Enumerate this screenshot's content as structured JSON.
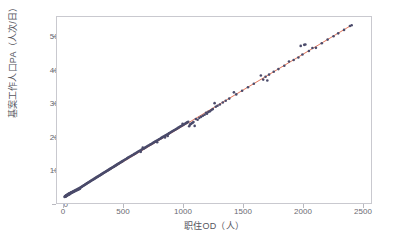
{
  "chart_data": {
    "type": "scatter",
    "title": "",
    "xlabel": "职住OD（人）",
    "ylabel": "基案工作人口PA（人次/日）",
    "xlim": [
      -60,
      2620
    ],
    "ylim": [
      -180,
      5560
    ],
    "xticks": [
      0,
      500,
      1000,
      1500,
      2000,
      2500
    ],
    "yticks": [
      0,
      1000,
      2000,
      3000,
      4000,
      5000
    ],
    "xtick_labels": [
      "0",
      "500",
      "1000",
      "1500",
      "2000",
      "2500"
    ],
    "ytick_labels": [
      "0",
      "1000",
      "2000",
      "3000",
      "4000",
      "5000"
    ],
    "grid": false,
    "legend": null,
    "point_color": "#4b4b6b",
    "point_size": 1.9,
    "frame_color": "#c9c9cf",
    "tick_color": "#6b6b72",
    "series": [
      {
        "name": "观测点",
        "type": "scatter",
        "points": [
          [
            5,
            8
          ],
          [
            8,
            20
          ],
          [
            10,
            15
          ],
          [
            12,
            35
          ],
          [
            14,
            22
          ],
          [
            16,
            48
          ],
          [
            18,
            30
          ],
          [
            20,
            55
          ],
          [
            22,
            40
          ],
          [
            24,
            68
          ],
          [
            26,
            50
          ],
          [
            28,
            75
          ],
          [
            30,
            60
          ],
          [
            32,
            88
          ],
          [
            34,
            70
          ],
          [
            36,
            95
          ],
          [
            38,
            78
          ],
          [
            40,
            105
          ],
          [
            42,
            85
          ],
          [
            44,
            112
          ],
          [
            46,
            92
          ],
          [
            48,
            120
          ],
          [
            50,
            100
          ],
          [
            52,
            130
          ],
          [
            55,
            110
          ],
          [
            58,
            140
          ],
          [
            60,
            125
          ],
          [
            63,
            150
          ],
          [
            66,
            135
          ],
          [
            69,
            160
          ],
          [
            72,
            145
          ],
          [
            75,
            172
          ],
          [
            78,
            158
          ],
          [
            81,
            185
          ],
          [
            84,
            168
          ],
          [
            87,
            195
          ],
          [
            90,
            180
          ],
          [
            94,
            208
          ],
          [
            97,
            190
          ],
          [
            100,
            220
          ],
          [
            104,
            205
          ],
          [
            108,
            235
          ],
          [
            112,
            218
          ],
          [
            116,
            250
          ],
          [
            120,
            232
          ],
          [
            124,
            265
          ],
          [
            128,
            248
          ],
          [
            132,
            280
          ],
          [
            136,
            262
          ],
          [
            140,
            298
          ],
          [
            145,
            305
          ],
          [
            150,
            318
          ],
          [
            155,
            330
          ],
          [
            160,
            342
          ],
          [
            165,
            352
          ],
          [
            170,
            368
          ],
          [
            175,
            378
          ],
          [
            180,
            392
          ],
          [
            185,
            400
          ],
          [
            190,
            412
          ],
          [
            195,
            425
          ],
          [
            200,
            438
          ],
          [
            205,
            445
          ],
          [
            210,
            458
          ],
          [
            215,
            470
          ],
          [
            220,
            482
          ],
          [
            225,
            492
          ],
          [
            230,
            505
          ],
          [
            235,
            515
          ],
          [
            240,
            528
          ],
          [
            245,
            538
          ],
          [
            250,
            548
          ],
          [
            255,
            560
          ],
          [
            260,
            572
          ],
          [
            265,
            582
          ],
          [
            270,
            595
          ],
          [
            275,
            605
          ],
          [
            280,
            618
          ],
          [
            285,
            628
          ],
          [
            290,
            640
          ],
          [
            295,
            650
          ],
          [
            300,
            662
          ],
          [
            305,
            672
          ],
          [
            310,
            685
          ],
          [
            315,
            695
          ],
          [
            320,
            708
          ],
          [
            325,
            718
          ],
          [
            330,
            728
          ],
          [
            335,
            742
          ],
          [
            340,
            752
          ],
          [
            345,
            762
          ],
          [
            350,
            775
          ],
          [
            355,
            785
          ],
          [
            360,
            798
          ],
          [
            365,
            808
          ],
          [
            370,
            818
          ],
          [
            375,
            832
          ],
          [
            380,
            842
          ],
          [
            385,
            852
          ],
          [
            390,
            865
          ],
          [
            395,
            875
          ],
          [
            400,
            888
          ],
          [
            405,
            898
          ],
          [
            410,
            908
          ],
          [
            415,
            922
          ],
          [
            420,
            932
          ],
          [
            425,
            942
          ],
          [
            430,
            955
          ],
          [
            435,
            965
          ],
          [
            440,
            978
          ],
          [
            445,
            988
          ],
          [
            450,
            998
          ],
          [
            455,
            1012
          ],
          [
            460,
            1022
          ],
          [
            465,
            1035
          ],
          [
            470,
            1045
          ],
          [
            475,
            1055
          ],
          [
            480,
            1068
          ],
          [
            485,
            1078
          ],
          [
            490,
            1092
          ],
          [
            495,
            1102
          ],
          [
            500,
            1112
          ],
          [
            508,
            1130
          ],
          [
            515,
            1148
          ],
          [
            522,
            1162
          ],
          [
            530,
            1180
          ],
          [
            538,
            1198
          ],
          [
            545,
            1212
          ],
          [
            552,
            1228
          ],
          [
            560,
            1245
          ],
          [
            568,
            1262
          ],
          [
            575,
            1278
          ],
          [
            582,
            1292
          ],
          [
            590,
            1310
          ],
          [
            598,
            1328
          ],
          [
            605,
            1342
          ],
          [
            612,
            1358
          ],
          [
            620,
            1375
          ],
          [
            628,
            1392
          ],
          [
            635,
            1408
          ],
          [
            642,
            1422
          ],
          [
            650,
            1440
          ],
          [
            655,
            1398
          ],
          [
            660,
            1462
          ],
          [
            668,
            1478
          ],
          [
            672,
            1528
          ],
          [
            678,
            1495
          ],
          [
            685,
            1512
          ],
          [
            692,
            1528
          ],
          [
            700,
            1545
          ],
          [
            708,
            1562
          ],
          [
            715,
            1578
          ],
          [
            722,
            1592
          ],
          [
            730,
            1610
          ],
          [
            738,
            1628
          ],
          [
            745,
            1642
          ],
          [
            752,
            1658
          ],
          [
            760,
            1675
          ],
          [
            768,
            1692
          ],
          [
            775,
            1708
          ],
          [
            782,
            1722
          ],
          [
            790,
            1740
          ],
          [
            795,
            1695
          ],
          [
            798,
            1758
          ],
          [
            805,
            1772
          ],
          [
            812,
            1788
          ],
          [
            820,
            1805
          ],
          [
            828,
            1822
          ],
          [
            835,
            1838
          ],
          [
            842,
            1852
          ],
          [
            850,
            1870
          ],
          [
            858,
            1888
          ],
          [
            862,
            1842
          ],
          [
            865,
            1902
          ],
          [
            872,
            1918
          ],
          [
            880,
            1935
          ],
          [
            885,
            1888
          ],
          [
            888,
            1952
          ],
          [
            895,
            1968
          ],
          [
            902,
            1982
          ],
          [
            910,
            2000
          ],
          [
            918,
            2018
          ],
          [
            925,
            2032
          ],
          [
            932,
            2048
          ],
          [
            940,
            2065
          ],
          [
            948,
            2082
          ],
          [
            955,
            2098
          ],
          [
            962,
            2112
          ],
          [
            970,
            2130
          ],
          [
            978,
            2148
          ],
          [
            985,
            2162
          ],
          [
            992,
            2178
          ],
          [
            1000,
            2195
          ],
          [
            1008,
            2212
          ],
          [
            1012,
            2262
          ],
          [
            1015,
            2228
          ],
          [
            1022,
            2242
          ],
          [
            1030,
            2260
          ],
          [
            1038,
            2278
          ],
          [
            1045,
            2292
          ],
          [
            1052,
            2308
          ],
          [
            1060,
            2325
          ],
          [
            1068,
            2188
          ],
          [
            1075,
            2238
          ],
          [
            1082,
            2258
          ],
          [
            1090,
            2278
          ],
          [
            1098,
            2298
          ],
          [
            1105,
            2318
          ],
          [
            1115,
            2200
          ],
          [
            1125,
            2412
          ],
          [
            1140,
            2388
          ],
          [
            1155,
            2448
          ],
          [
            1170,
            2478
          ],
          [
            1185,
            2512
          ],
          [
            1200,
            2545
          ],
          [
            1212,
            2608
          ],
          [
            1220,
            2578
          ],
          [
            1232,
            2632
          ],
          [
            1245,
            2648
          ],
          [
            1258,
            2688
          ],
          [
            1270,
            2718
          ],
          [
            1285,
            2902
          ],
          [
            1295,
            2792
          ],
          [
            1310,
            2822
          ],
          [
            1330,
            2862
          ],
          [
            1355,
            2920
          ],
          [
            1380,
            2978
          ],
          [
            1410,
            3042
          ],
          [
            1450,
            3235
          ],
          [
            1470,
            3172
          ],
          [
            1520,
            3282
          ],
          [
            1570,
            3390
          ],
          [
            1620,
            3498
          ],
          [
            1680,
            3755
          ],
          [
            1700,
            3628
          ],
          [
            1720,
            3718
          ],
          [
            1735,
            3602
          ],
          [
            1750,
            3782
          ],
          [
            1790,
            3868
          ],
          [
            1830,
            3952
          ],
          [
            1880,
            4058
          ],
          [
            1920,
            4188
          ],
          [
            1960,
            4232
          ],
          [
            2000,
            4312
          ],
          [
            2020,
            4668
          ],
          [
            2035,
            4402
          ],
          [
            2050,
            4700
          ],
          [
            2060,
            4712
          ],
          [
            2090,
            4512
          ],
          [
            2120,
            4602
          ],
          [
            2150,
            4608
          ],
          [
            2200,
            4752
          ],
          [
            2250,
            4862
          ],
          [
            2300,
            4968
          ],
          [
            2340,
            5055
          ],
          [
            2390,
            5162
          ],
          [
            2440,
            5282
          ],
          [
            2455,
            5305
          ]
        ]
      },
      {
        "name": "拟合直线",
        "type": "line",
        "color": "#e0674a",
        "slope": 2.163,
        "intercept": 0,
        "x_range": [
          0,
          2455
        ]
      }
    ]
  },
  "axis": {
    "x": {
      "label": "职住OD（人）",
      "ticks": [
        "0",
        "500",
        "1000",
        "1500",
        "2000",
        "2500"
      ]
    },
    "y": {
      "label": "基案工作人口PA（人次/日）",
      "ticks": [
        "0",
        "1000",
        "2000",
        "3000",
        "4000",
        "5000"
      ]
    }
  }
}
